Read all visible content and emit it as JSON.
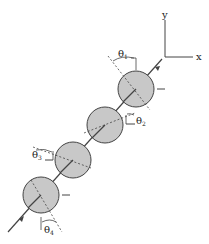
{
  "axes": {
    "x_label": "x",
    "y_label": "y"
  },
  "angles": [
    {
      "symbol": "θ",
      "subscript": "1"
    },
    {
      "symbol": "θ",
      "subscript": "2"
    },
    {
      "symbol": "θ",
      "subscript": "3"
    },
    {
      "symbol": "θ",
      "subscript": "4"
    }
  ],
  "colors": {
    "disk_fill": "#c8c8c8",
    "line": "#333333",
    "background": "#ffffff"
  },
  "disks": [
    {
      "id": 1,
      "cx": 136,
      "cy": 89,
      "r": 18
    },
    {
      "id": 2,
      "cx": 105,
      "cy": 125,
      "r": 18
    },
    {
      "id": 3,
      "cx": 73,
      "cy": 160,
      "r": 18
    },
    {
      "id": 4,
      "cx": 41,
      "cy": 195,
      "r": 18
    }
  ]
}
